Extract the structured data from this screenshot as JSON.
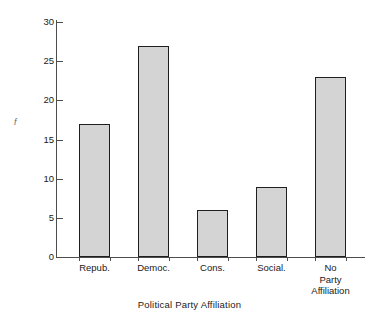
{
  "chart_data": {
    "type": "bar",
    "title": "",
    "subtitle": "",
    "xlabel": "Political Party Affiliation",
    "ylabel": "f",
    "categories": [
      "Repub.",
      "Democ.",
      "Cons.",
      "Social.",
      "No\nParty\nAffiliation"
    ],
    "values": [
      17,
      27,
      6,
      9,
      23
    ],
    "ylim": [
      0,
      30
    ],
    "yticks": [
      0,
      5,
      10,
      15,
      20,
      25,
      30
    ],
    "ytick_labels": [
      "0",
      "5",
      "10",
      "15",
      "20",
      "25",
      "30"
    ],
    "grid": false,
    "legend": null,
    "annotations": [],
    "style": {
      "bar_fill": "#d4d4d4",
      "bar_edge": "#1f1f1f",
      "axis_color": "#4d4d4d",
      "background": "#ffffff",
      "text_color": "#1a1a1a"
    }
  }
}
